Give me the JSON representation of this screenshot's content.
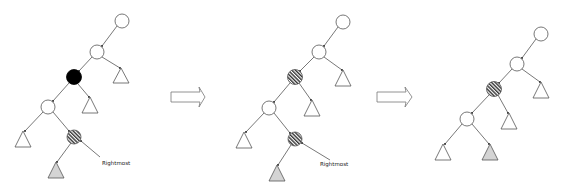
{
  "diagram": {
    "colors": {
      "stroke": "#555555",
      "node_fill": "#ffffff",
      "black_node": "#000000",
      "hatch": "#333333",
      "gray_subtree": "#d4d4d4",
      "arrow_stroke": "#777777"
    },
    "panels": [
      {
        "id": "step-1",
        "label": "Rightmost",
        "nodes": [
          {
            "id": "root",
            "x": 122,
            "y": 21,
            "style": "white"
          },
          {
            "id": "n2",
            "x": 97,
            "y": 52,
            "style": "white"
          },
          {
            "id": "n3",
            "x": 74,
            "y": 77,
            "style": "black"
          },
          {
            "id": "n4",
            "x": 48,
            "y": 107,
            "style": "white"
          },
          {
            "id": "n5",
            "x": 74,
            "y": 137,
            "style": "hatched"
          }
        ],
        "subtrees": [
          {
            "id": "t-n2-right",
            "x": 121,
            "y": 68,
            "style": "white"
          },
          {
            "id": "t-n3-right",
            "x": 90,
            "y": 97,
            "style": "white"
          },
          {
            "id": "t-n4-left",
            "x": 23,
            "y": 131,
            "style": "white"
          },
          {
            "id": "t-n5-left",
            "x": 56,
            "y": 162,
            "style": "gray"
          }
        ]
      },
      {
        "id": "step-2",
        "label": "Rightmost",
        "nodes": [
          {
            "id": "root",
            "x": 343,
            "y": 22,
            "style": "white"
          },
          {
            "id": "n2",
            "x": 319,
            "y": 52,
            "style": "white"
          },
          {
            "id": "n3",
            "x": 295,
            "y": 77,
            "style": "hatched"
          },
          {
            "id": "n4",
            "x": 269,
            "y": 108,
            "style": "white"
          },
          {
            "id": "n5",
            "x": 295,
            "y": 139,
            "style": "hatched"
          }
        ],
        "subtrees": [
          {
            "id": "t-n2-right",
            "x": 343,
            "y": 70,
            "style": "white"
          },
          {
            "id": "t-n3-right",
            "x": 312,
            "y": 100,
            "style": "white"
          },
          {
            "id": "t-n4-left",
            "x": 244,
            "y": 132,
            "style": "white"
          },
          {
            "id": "t-n5-left",
            "x": 277,
            "y": 165,
            "style": "gray"
          }
        ]
      },
      {
        "id": "step-3",
        "label": "",
        "nodes": [
          {
            "id": "root",
            "x": 541,
            "y": 34,
            "style": "white"
          },
          {
            "id": "n2",
            "x": 517,
            "y": 64,
            "style": "white"
          },
          {
            "id": "n3",
            "x": 494,
            "y": 89,
            "style": "hatched"
          },
          {
            "id": "n4",
            "x": 467,
            "y": 119,
            "style": "white"
          }
        ],
        "subtrees": [
          {
            "id": "t-n2-right",
            "x": 541,
            "y": 82,
            "style": "white"
          },
          {
            "id": "t-n3-right",
            "x": 509,
            "y": 113,
            "style": "white"
          },
          {
            "id": "t-n4-left",
            "x": 443,
            "y": 144,
            "style": "white"
          },
          {
            "id": "t-n4-right",
            "x": 490,
            "y": 144,
            "style": "gray"
          }
        ]
      }
    ],
    "arrows": [
      {
        "id": "arrow-1",
        "x": 171,
        "y": 97
      },
      {
        "id": "arrow-2",
        "x": 377,
        "y": 97
      }
    ],
    "labels": {
      "rightmost_1": "Rightmost",
      "rightmost_2": "Rightmost"
    }
  }
}
